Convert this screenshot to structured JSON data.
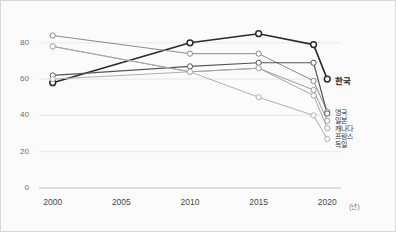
{
  "chart_data": {
    "type": "line",
    "title": "",
    "xlabel": "(년)",
    "ylabel": "",
    "x": [
      2000,
      2005,
      2010,
      2015,
      2019,
      2020
    ],
    "xticks": [
      "2000",
      "2005",
      "2010",
      "2015",
      "2020"
    ],
    "xtick_values": [
      2000,
      2005,
      2010,
      2015,
      2020
    ],
    "yticks": [
      "0",
      "20",
      "40",
      "60",
      "80"
    ],
    "ytick_values": [
      0,
      20,
      40,
      60,
      80
    ],
    "ylim": [
      0,
      92
    ],
    "xlim": [
      1999,
      2021
    ],
    "grid": true,
    "legend_position": "right-end-of-line",
    "series": [
      {
        "name": "한국",
        "color": "#2b2b2b",
        "width": 1.6,
        "x": [
          2000,
          2010,
          2015,
          2019,
          2020
        ],
        "values": [
          58,
          80,
          85,
          79,
          60
        ]
      },
      {
        "name": "영국",
        "color": "#8a8a8a",
        "width": 1.0,
        "x": [
          2000,
          2010,
          2015,
          2019,
          2020
        ],
        "values": [
          84,
          74,
          74,
          59,
          42
        ]
      },
      {
        "name": "일본",
        "color": "#555555",
        "width": 1.2,
        "x": [
          2000,
          2010,
          2015,
          2019,
          2020
        ],
        "values": [
          62,
          67,
          69,
          69,
          41
        ]
      },
      {
        "name": "캐나다",
        "color": "#9b9b9b",
        "width": 1.0,
        "x": [
          2000,
          2010,
          2015,
          2019,
          2020
        ],
        "values": [
          78,
          64,
          66,
          54,
          37
        ]
      },
      {
        "name": "프랑스",
        "color": "#a8a8a8",
        "width": 1.0,
        "x": [
          2000,
          2010,
          2015,
          2019,
          2020
        ],
        "values": [
          78,
          64,
          66,
          51,
          33
        ]
      },
      {
        "name": "독일",
        "color": "#b0b0b0",
        "width": 1.0,
        "x": [
          2000,
          2010,
          2015,
          2019,
          2020
        ],
        "values": [
          60,
          64,
          50,
          40,
          27
        ]
      }
    ],
    "marker": {
      "shape": "circle-open",
      "face": "#ffffff",
      "radius": 2.6
    },
    "axis_color": "#cfcfcf",
    "grid_color": "#e3e3e3",
    "background": "#fbfbfb"
  },
  "axes": {
    "y_labels": [
      "80",
      "60",
      "40",
      "20",
      "0"
    ],
    "x_labels": [
      "2000",
      "2005",
      "2010",
      "2015",
      "2020"
    ],
    "x_unit": "(년)"
  },
  "legend": {
    "items": [
      {
        "label": "한국"
      },
      {
        "label": "영국"
      },
      {
        "label": "일본"
      },
      {
        "label": "캐나다"
      },
      {
        "label": "프랑스"
      },
      {
        "label": "독일"
      }
    ]
  }
}
